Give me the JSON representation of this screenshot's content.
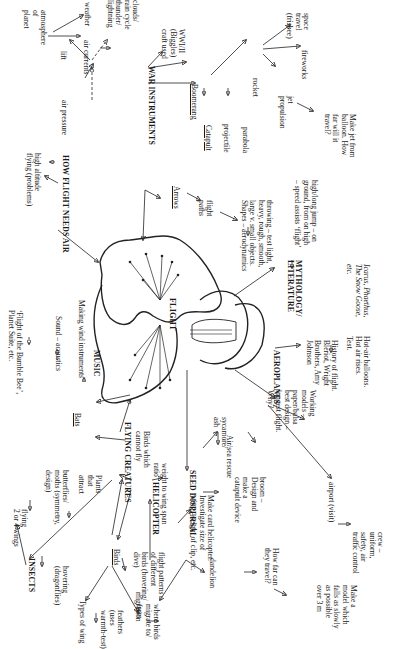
{
  "diagram": {
    "orientation": "rotated 90 degrees clockwise",
    "colors": {
      "ink": "#1a1a1a",
      "background": "#ffffff"
    },
    "center": {
      "label": "FLIGHT",
      "shape": "butterfly"
    },
    "hubs": {
      "how_flight_needs_air": "HOW FLIGHT NEEDS AIR",
      "war_instruments": "WAR INSTRUMENTS",
      "mythology": "MYTHOLOGY/\nLITERATURE",
      "aeroplanes": "AEROPLANES",
      "seed_dispersal": "SEED DISPERSAL",
      "helicopter": "HELICOPTER",
      "flying_creatures": "FLYING CREATURES",
      "insects": "INSECTS",
      "music": "MUSIC"
    },
    "nodes": {
      "air_pressure": "air pressure",
      "high_altitude": "high altitude\nflying (problems)",
      "lift": "lift",
      "atmosphere": "atmosphere\nof\nplanet",
      "air_currents": "air currents",
      "weather": "weather",
      "clouds": "clouds/\nrain cycle\nthunder/\nlightning",
      "ww": "WWI/II\n(Biggles)\ncraft used",
      "boomerang": "Boomerang",
      "catapult": "Catapult",
      "projectile": "projectile",
      "parabola": "parabola",
      "rocket": "rocket",
      "space_travel": "space\ntravel\n(frisbee)",
      "fireworks": "fireworks",
      "jet_propulsion": "jet\npropulsion",
      "make_jet": "Make jet from\nballoon. How\nfar will it\ntravel?",
      "arrows": "Arrows",
      "flight_paths": "flight\npaths",
      "throwing": "throwing – test light,\nheavy, rough, smooth,\nlarge v. small objects.\nShapes – aerodynamics",
      "high_long_jump": "high/long jump – on\nground, from on high\n– speed assists ‘flight’",
      "icarus": "Icarus, Phaethus,\nThe Snow Goose,\netc.",
      "history": "History of flight.\nBlériot, Wright\nBrothers, Amy\nJohnson",
      "hot_air": "Hot-air balloons.\nHot air rises.\nTest.",
      "working_models": "Working\nmodels –\npaper/balsa\nbest design –\nlongest flight.\nWhy?",
      "airport": "airport (visit)",
      "crew": "crew –\nuniform,\nsafety, air\ntraffic control",
      "sycamore": "sycamore/\nash",
      "broom": "broom –\nDesign and\nmake a\ncatapult device",
      "air_sea_rescue": "Air/sea rescue",
      "dandelion": "dandelion",
      "how_far": "How far can\nthey travel?",
      "make_model": "Make a\nmodel which\nfalls as slowly\nas possible\nover 3 m",
      "card_helicopter": "Make card helicopter.\nInvestigate size of\nwing, weight of clip, etc.",
      "bats": "Bats",
      "birds_cannot_fly": "Birds which\ncannot fly",
      "weight_wing_span": "weight to wing span\nratio",
      "birds": "Birds",
      "flight_patterns": "flight patterns\nof different\nbirds (hovering/\ndive)",
      "types_of_wing": "Types of wing",
      "feathers": "feathers\n(uses\nwarmth-test)",
      "migration": "migration",
      "where_birds": "where birds\nmigrate to/\nfrom",
      "flying_2_4": "flying\n2 or 4 wings",
      "butterflies": "butterflies/\nmoths (symmetry,\ndesign)",
      "plants": "Plants\nthat\nattract",
      "hovering": "hovering\n(dragonflies)",
      "bumble_bee": "‘Flight of the Bumble Bee’,\nPlanet Suite, etc.",
      "sound": "Sound – acoustics",
      "wind_instruments": "Making wind instruments"
    }
  }
}
